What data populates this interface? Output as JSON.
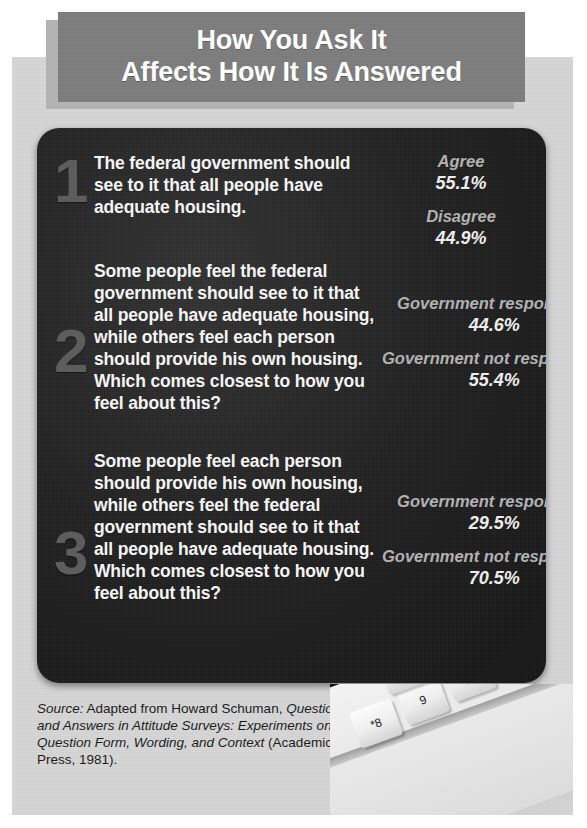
{
  "title": {
    "line1": "How You Ask It",
    "line2": "Affects How It Is Answered"
  },
  "questions": [
    {
      "numeral": "1",
      "text": "The federal government should see to it that all people have adequate housing.",
      "results": [
        {
          "label": "Agree",
          "value": "55.1%"
        },
        {
          "label": "Disagree",
          "value": "44.9%"
        }
      ]
    },
    {
      "numeral": "2",
      "text": "Some people feel the federal government should see to it that all people have adequate housing, while others feel each person should provide his own housing. Which comes closest to how you feel about this?",
      "results": [
        {
          "label": "Government responsible",
          "value": "44.6%"
        },
        {
          "label": "Government not responsible",
          "value": "55.4%"
        }
      ]
    },
    {
      "numeral": "3",
      "text": "Some people feel each person should provide his own housing, while others feel the federal government should see to it that all people have adequate housing. Which comes closest to how you feel about this?",
      "results": [
        {
          "label": "Government responsible",
          "value": "29.5%"
        },
        {
          "label": "Government not responsible",
          "value": "70.5%"
        }
      ]
    }
  ],
  "source": {
    "lead": "Source:",
    "attribution": " Adapted from Howard Schuman, ",
    "work": "Questions and Answers in Attitude Surveys: Experiments on Question Form, Wording, and Context",
    "publisher": " (Academic Press, 1981)."
  },
  "keyboard": {
    "keys": [
      "*8",
      "9",
      ")0",
      "-",
      "+",
      "[",
      "]",
      "\\",
      ";",
      "P",
      "O",
      "delete"
    ]
  },
  "colors": {
    "panel_dark": "#1d1d1d",
    "banner_gray": "#7b7b7b",
    "paper_gray": "#d6d6d6",
    "numeral_gray": "#5d5d5d",
    "label_gray": "#b2b2b2",
    "text_white": "#f4f4f4"
  }
}
